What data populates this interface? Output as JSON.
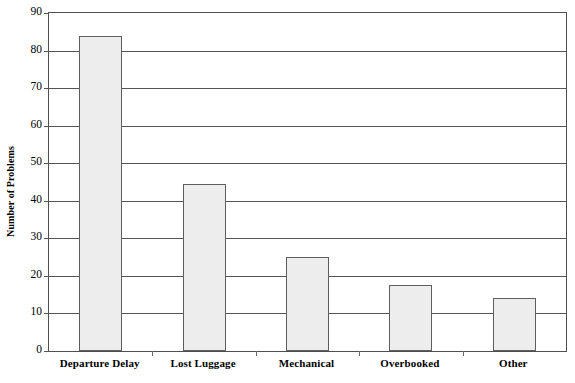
{
  "chart_data": {
    "type": "bar",
    "title": "",
    "subtitle": "",
    "xlabel": "",
    "ylabel": "Number of Problems",
    "categories": [
      "Departure Delay",
      "Lost Luggage",
      "Mechanical",
      "Overbooked",
      "Other"
    ],
    "values": [
      84,
      44.5,
      25,
      17.5,
      14
    ],
    "ylim": [
      0,
      90
    ],
    "y_ticks": [
      0,
      10,
      20,
      30,
      40,
      50,
      60,
      70,
      80,
      90
    ],
    "y_tick_labels": [
      "0",
      "10",
      "20",
      "30",
      "40",
      "50",
      "60",
      "70",
      "80",
      "90"
    ],
    "grid": "horizontal",
    "legend": "none",
    "bar_fill_color": "#ededed",
    "bar_border_color": "#5e5e5e",
    "axis_color": "#4f4f4f",
    "gridline_color": "#555555",
    "background_color": "#ffffff"
  }
}
